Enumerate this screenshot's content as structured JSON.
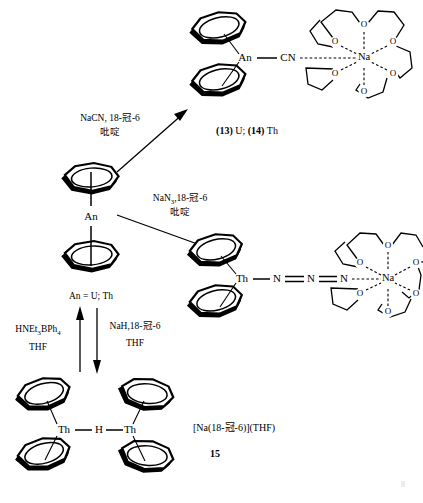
{
  "scheme": {
    "title_text": "",
    "central": {
      "metal_label": "An",
      "caption": "An = U; Th"
    },
    "reagents": {
      "cyanide": {
        "line1_main": "NaCN, 18-",
        "line1_cjk": "冠",
        "line1_tail": "-6",
        "line2": "吡啶"
      },
      "azide": {
        "line1_main": "NaN",
        "line1_sub": "3",
        "line1_mid": ",18-",
        "line1_cjk": "冠",
        "line1_tail": "-6",
        "line2": "吡啶"
      },
      "up_arrow": {
        "line1_main": "HNEt",
        "line1_sub": "3",
        "line1_tail": "BPh",
        "line1_sub2": "4",
        "line2": "THF"
      },
      "down_arrow": {
        "line1_main": "NaH,18-",
        "line1_cjk": "冠",
        "line1_tail": "-6",
        "line2": "THF"
      }
    },
    "products": {
      "cyanide_complex": {
        "metal_label": "An",
        "ligand_label": "CN",
        "cation_label": "Na",
        "oxygen_label": "O",
        "caption_a": "(13)",
        "caption_a_tail": " U; ",
        "caption_b": "(14)",
        "caption_b_tail": " Th"
      },
      "azide_complex": {
        "metal_label": "Th",
        "n1": "N",
        "n2": "N",
        "n3": "N",
        "cation_label": "Na",
        "oxygen_label": "O"
      },
      "hydride_dimer": {
        "metal_left": "Th",
        "bridge": "H",
        "metal_right": "Th",
        "counterion_main": "[Na(18-",
        "counterion_cjk": "冠",
        "counterion_tail": "-6)](THF)",
        "compound_number": "15"
      }
    },
    "page_mark": "8"
  },
  "colors": {
    "ink": "#000000",
    "paper": "#ffffff",
    "faint": "#cfcfcf"
  }
}
